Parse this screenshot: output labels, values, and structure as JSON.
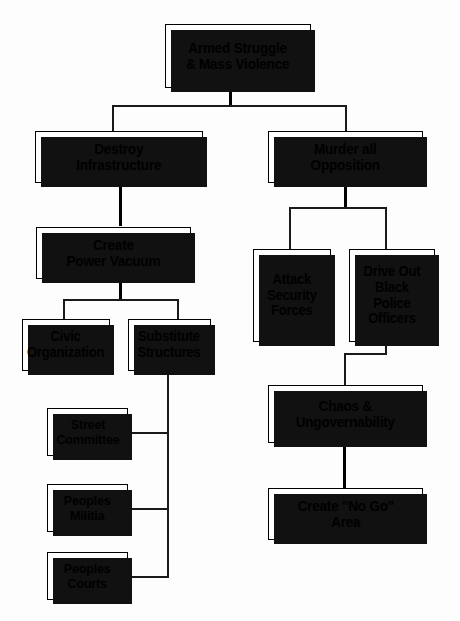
{
  "diagram": {
    "background_color": "#fdfdfd",
    "box_fill_color": "#ffffff",
    "border_color": "#000000",
    "shadow_color": "#111111",
    "nodes": {
      "root": "Armed Struggle\n& Mass Violence",
      "destroy_infrastructure": "Destroy\nInfrastructure",
      "murder_opposition": "Murder all\nOpposition",
      "create_power_vacuum": "Create\nPower Vacuum",
      "attack_security_forces": "Attack\nSecurity\nForces",
      "drive_out_black_police": "Drive Out\nBlack Police\nOfficers",
      "civic_organization": "Civic\nOrganization",
      "substitute_structures": "Substitute\nStructures",
      "street_committee": "Street\nCommittee",
      "peoples_militia": "Peoples\nMilitia",
      "peoples_courts": "Peoples\nCourts",
      "chaos_ungovernability": "Chaos &\nUngovernability",
      "create_no_go_area": "Create \"No Go\"\nArea"
    }
  }
}
